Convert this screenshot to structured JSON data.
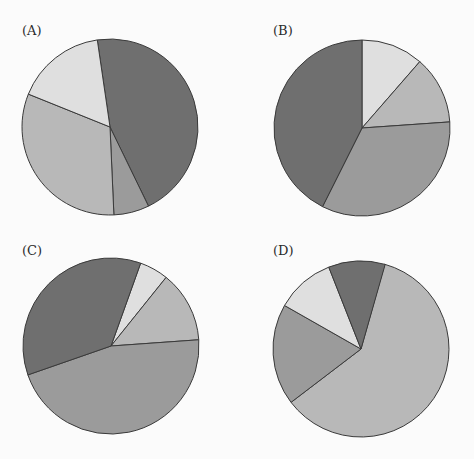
{
  "figure": {
    "panels": [
      "(A)",
      "(B)",
      "(C)",
      "(D)"
    ]
  },
  "palette": {
    "dark": "#6f6f6f",
    "medium": "#9b9b9b",
    "light": "#b8b8b8",
    "pale": "#dfdfdf",
    "stroke": "#3a3a3a"
  },
  "chart_data": [
    {
      "type": "pie",
      "title": "(A)",
      "start_angle_deg": 351.7,
      "direction": "clockwise",
      "center": [
        110,
        127
      ],
      "radius": 88,
      "slices": [
        {
          "shade": "dark",
          "percent": 45.1
        },
        {
          "shade": "medium",
          "percent": 6.5
        },
        {
          "shade": "light",
          "percent": 31.8
        },
        {
          "shade": "pale",
          "percent": 16.6
        }
      ]
    },
    {
      "type": "pie",
      "title": "(B)",
      "start_angle_deg": 0,
      "direction": "clockwise",
      "center": [
        362,
        128
      ],
      "radius": 88,
      "slices": [
        {
          "shade": "pale",
          "percent": 11.4
        },
        {
          "shade": "light",
          "percent": 12.5
        },
        {
          "shade": "medium",
          "percent": 33.5
        },
        {
          "shade": "dark",
          "percent": 42.6
        }
      ]
    },
    {
      "type": "pie",
      "title": "(C)",
      "start_angle_deg": 19.7,
      "direction": "clockwise",
      "center": [
        111,
        346
      ],
      "radius": 88,
      "slices": [
        {
          "shade": "pale",
          "percent": 5.3
        },
        {
          "shade": "light",
          "percent": 13.1
        },
        {
          "shade": "medium",
          "percent": 45.8
        },
        {
          "shade": "dark",
          "percent": 35.8
        }
      ]
    },
    {
      "type": "pie",
      "title": "(D)",
      "start_angle_deg": 15.6,
      "direction": "clockwise",
      "center": [
        361,
        349
      ],
      "radius": 88,
      "slices": [
        {
          "shade": "light",
          "percent": 60.3
        },
        {
          "shade": "medium",
          "percent": 18.6
        },
        {
          "shade": "pale",
          "percent": 10.8
        },
        {
          "shade": "dark",
          "percent": 10.4
        }
      ]
    }
  ]
}
